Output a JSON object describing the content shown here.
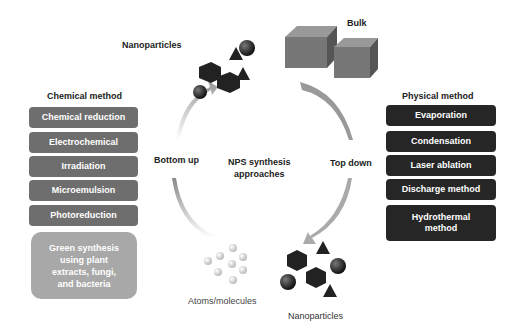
{
  "center": {
    "title_line1": "NPS synthesis",
    "title_line2": "approaches"
  },
  "labels": {
    "bottom_up": "Bottom up",
    "top_down": "Top down",
    "nanoparticles_top": "Nanoparticles",
    "nanoparticles_bottom": "Nanoparticles",
    "bulk": "Bulk",
    "atoms": "Atoms/molecules"
  },
  "chemical": {
    "heading": "Chemical method",
    "items": [
      "Chemical reduction",
      "Electrochemical",
      "Irradiation",
      "Microemulsion",
      "Photoreduction"
    ],
    "green": [
      "Green synthesis",
      "using plant",
      "extracts, fungi,",
      "and bacteria"
    ]
  },
  "physical": {
    "heading": "Physical method",
    "items": [
      "Evaporation",
      "Condensation",
      "Laser ablation",
      "Discharge method"
    ],
    "last": [
      "Hydrothermal",
      "method"
    ]
  },
  "colors": {
    "chemical_box": "#6e6e6e",
    "physical_box": "#262626",
    "green_box": "#a8a8a8"
  }
}
